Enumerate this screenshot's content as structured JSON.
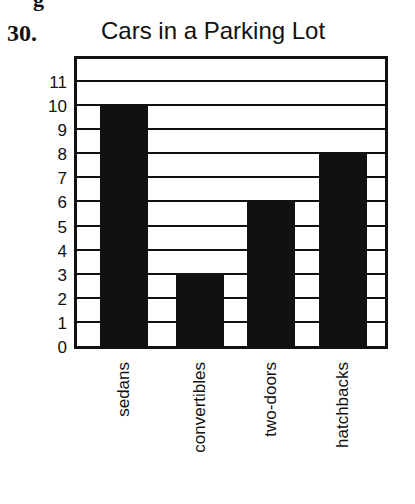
{
  "page": {
    "cut_text": "g",
    "question_number": "30."
  },
  "chart_data": {
    "type": "bar",
    "title": "Cars in a Parking Lot",
    "categories": [
      "sedans",
      "convertibles",
      "two-doors",
      "hatchbacks"
    ],
    "values": [
      10,
      3,
      6,
      8
    ],
    "xlabel": "",
    "ylabel": "",
    "ylim": [
      0,
      12
    ],
    "yticks": [
      "0",
      "1",
      "2",
      "3",
      "4",
      "5",
      "6",
      "7",
      "8",
      "9",
      "10",
      "11"
    ],
    "grid": true,
    "legend": null,
    "bar_color": "#111111",
    "x_label_rotation": -90
  }
}
